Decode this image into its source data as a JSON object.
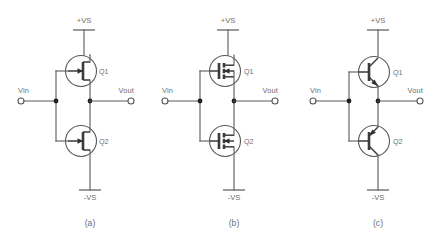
{
  "figure": {
    "background_color": "#ffffff",
    "wire_color": "#58595b",
    "text_color": "#6d6e71",
    "device_color": "#3b3b3d"
  },
  "circuits": [
    {
      "caption": "(a)",
      "device_type": "jfet",
      "top_rail": "+VS",
      "bottom_rail": "-VS",
      "input_label": "Vin",
      "output_label": "Vout",
      "top_device_label": "Q1",
      "bottom_device_label": "Q2"
    },
    {
      "caption": "(b)",
      "device_type": "mosfet",
      "top_rail": "+VS",
      "bottom_rail": "-VS",
      "input_label": "Vin",
      "output_label": "Vout",
      "top_device_label": "Q1",
      "bottom_device_label": "Q2"
    },
    {
      "caption": "(c)",
      "device_type": "bjt",
      "top_rail": "+VS",
      "bottom_rail": "-VS",
      "input_label": "Vin",
      "output_label": "Vout",
      "top_device_label": "Q1",
      "bottom_device_label": "Q2"
    }
  ]
}
